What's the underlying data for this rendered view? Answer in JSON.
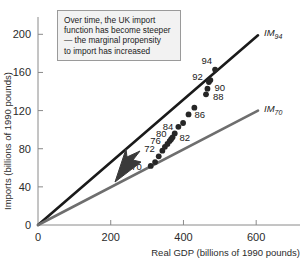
{
  "chart_data": {
    "type": "scatter",
    "title": "",
    "xlabel": "Real GDP (billions of 1990 pounds)",
    "ylabel": "Imports (billions of 1990 pounds)",
    "xlim": [
      0,
      660
    ],
    "ylim": [
      0,
      215
    ],
    "xticks": [
      0,
      200,
      400,
      600
    ],
    "yticks": [
      0,
      40,
      80,
      120,
      160,
      200
    ],
    "xtick_labels": [
      "0",
      "200",
      "400",
      "600"
    ],
    "ytick_labels": [
      "0",
      "40",
      "80",
      "120",
      "160",
      "200"
    ],
    "grid": false,
    "legend": "inline-line-labels",
    "points": [
      {
        "label": "70",
        "x": 310,
        "y": 62
      },
      {
        "label": "",
        "x": 322,
        "y": 66
      },
      {
        "label": "72",
        "x": 332,
        "y": 72
      },
      {
        "label": "",
        "x": 342,
        "y": 78
      },
      {
        "label": "76",
        "x": 349,
        "y": 82
      },
      {
        "label": "",
        "x": 356,
        "y": 85
      },
      {
        "label": "80",
        "x": 362,
        "y": 88
      },
      {
        "label": "",
        "x": 366,
        "y": 90
      },
      {
        "label": "82",
        "x": 370,
        "y": 92
      },
      {
        "label": "",
        "x": 376,
        "y": 96
      },
      {
        "label": "84",
        "x": 386,
        "y": 103
      },
      {
        "label": "",
        "x": 399,
        "y": 107
      },
      {
        "label": "86",
        "x": 414,
        "y": 116
      },
      {
        "label": "",
        "x": 430,
        "y": 123
      },
      {
        "label": "88",
        "x": 462,
        "y": 137
      },
      {
        "label": "90",
        "x": 466,
        "y": 143
      },
      {
        "label": "92",
        "x": 470,
        "y": 150
      },
      {
        "label": "",
        "x": 474,
        "y": 152
      },
      {
        "label": "94",
        "x": 487,
        "y": 163
      }
    ],
    "series": [
      {
        "name": "IM94",
        "display": "IM",
        "subscript": "94",
        "type": "line",
        "color": "#1a1a1a",
        "from": [
          0,
          0
        ],
        "to": [
          605,
          199
        ]
      },
      {
        "name": "IM70",
        "display": "IM",
        "subscript": "70",
        "type": "line",
        "color": "#6e6e6e",
        "from": [
          0,
          0
        ],
        "to": [
          605,
          120
        ]
      }
    ],
    "annotations": [
      {
        "name": "note",
        "lines": [
          "Over time, the UK import",
          "function has become steeper",
          "— the marginal propensity",
          "to import has increased"
        ]
      },
      {
        "name": "arrow",
        "description": "arrow pointing up-left between the two import lines"
      }
    ]
  }
}
